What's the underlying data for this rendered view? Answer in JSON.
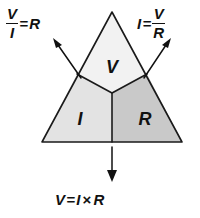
{
  "diagram": {
    "name": "ohms-law-triangle",
    "regions": [
      {
        "key": "v",
        "label": "V",
        "name": "voltage",
        "fill": "#f2f2f2"
      },
      {
        "key": "i",
        "label": "I",
        "name": "current",
        "fill": "#e3e3e3"
      },
      {
        "key": "r",
        "label": "R",
        "name": "resistance",
        "fill": "#c9c9c9"
      }
    ],
    "outline_color": "#1a1a1a",
    "arrow_color": "#111111"
  },
  "formulas": {
    "left": {
      "numerator": "V",
      "denominator": "I",
      "operator": "=",
      "result": "R",
      "plain": "V / I = R"
    },
    "right": {
      "lhs": "I",
      "operator": "=",
      "numerator": "V",
      "denominator": "R",
      "plain": "I = V / R"
    },
    "bottom": {
      "lhs": "V",
      "operator": "=",
      "first": "I",
      "times": "×",
      "second": "R",
      "plain": "V = I × R"
    }
  },
  "arrows": [
    {
      "name": "arrow-to-left-formula",
      "direction": "up-left"
    },
    {
      "name": "arrow-to-right-formula",
      "direction": "up-right"
    },
    {
      "name": "arrow-to-bottom-formula",
      "direction": "down"
    }
  ]
}
